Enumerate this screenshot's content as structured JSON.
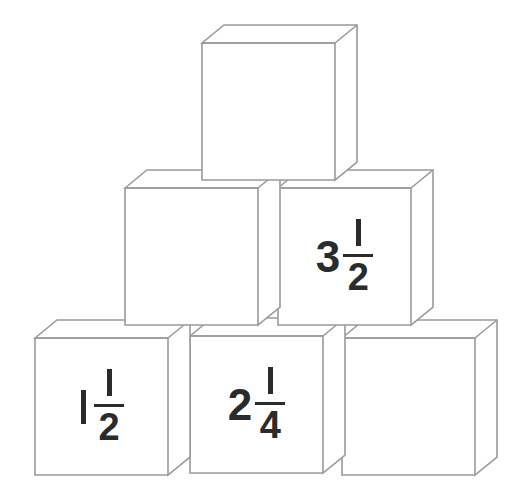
{
  "figure": {
    "background_color": "#ffffff",
    "edge_color": "#9a9a9a",
    "face_color": "#ffffff",
    "label_color": "#2b2b2b",
    "rows": 3,
    "cube_count": 6
  },
  "cubes": [
    {
      "id": "top-cube",
      "row": "top",
      "position": "top-center",
      "label": "",
      "has_label": false
    },
    {
      "id": "middle-left-cube",
      "row": "middle",
      "position": "middle-left",
      "label": "",
      "has_label": false
    },
    {
      "id": "middle-right-cube",
      "row": "middle",
      "position": "middle-right",
      "label": "3 1/2",
      "has_label": true,
      "whole": "3",
      "numerator": "1",
      "denominator": "2"
    },
    {
      "id": "bottom-left-cube",
      "row": "bottom",
      "position": "bottom-left",
      "label": "1 1/2",
      "has_label": true,
      "whole": "1",
      "numerator": "1",
      "denominator": "2"
    },
    {
      "id": "bottom-middle-cube",
      "row": "bottom",
      "position": "bottom-middle",
      "label": "2 1/4",
      "has_label": true,
      "whole": "2",
      "numerator": "1",
      "denominator": "4"
    },
    {
      "id": "bottom-right-cube",
      "row": "bottom",
      "position": "bottom-right",
      "label": "",
      "has_label": false
    }
  ],
  "labels": {
    "middle_right": {
      "whole": "3",
      "numerator": "1",
      "denominator": "2"
    },
    "bottom_left": {
      "whole": "1",
      "numerator": "1",
      "denominator": "2"
    },
    "bottom_middle": {
      "whole": "2",
      "numerator": "1",
      "denominator": "4"
    }
  }
}
